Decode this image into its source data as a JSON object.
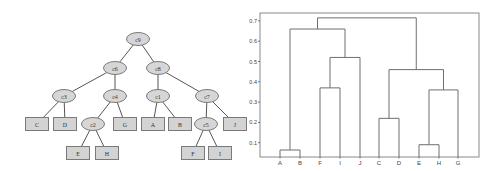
{
  "tree": {
    "nodes": [
      {
        "id": "c9",
        "label": "c9",
        "type": "cluster",
        "x": 138,
        "y": 39
      },
      {
        "id": "c6",
        "label": "c6",
        "type": "cluster",
        "x": 115,
        "y": 68
      },
      {
        "id": "c8",
        "label": "c8",
        "type": "cluster",
        "x": 158,
        "y": 68
      },
      {
        "id": "c3",
        "label": "c3",
        "type": "cluster",
        "x": 64,
        "y": 96
      },
      {
        "id": "c4",
        "label": "c4",
        "type": "cluster",
        "x": 115,
        "y": 96
      },
      {
        "id": "c1",
        "label": "c1",
        "type": "cluster",
        "x": 158,
        "y": 96
      },
      {
        "id": "c7",
        "label": "c7",
        "type": "cluster",
        "x": 207,
        "y": 96
      },
      {
        "id": "c2",
        "label": "c2",
        "type": "cluster",
        "x": 93,
        "y": 124
      },
      {
        "id": "c5",
        "label": "c5",
        "type": "cluster",
        "x": 206,
        "y": 124
      },
      {
        "id": "C",
        "label": "C",
        "type": "leaf",
        "x": 37,
        "y": 124
      },
      {
        "id": "D",
        "label": "D",
        "type": "leaf",
        "x": 65,
        "y": 124
      },
      {
        "id": "G",
        "label": "G",
        "type": "leaf",
        "x": 125,
        "y": 124
      },
      {
        "id": "A",
        "label": "A",
        "type": "leaf",
        "x": 153,
        "y": 124
      },
      {
        "id": "B",
        "label": "B",
        "type": "leaf",
        "x": 180,
        "y": 124
      },
      {
        "id": "J",
        "label": "J",
        "type": "leaf",
        "x": 235,
        "y": 124
      },
      {
        "id": "E",
        "label": "E",
        "type": "leaf",
        "x": 78,
        "y": 153
      },
      {
        "id": "H",
        "label": "H",
        "type": "leaf",
        "x": 107,
        "y": 153
      },
      {
        "id": "F",
        "label": "F",
        "type": "leaf",
        "x": 193,
        "y": 153
      },
      {
        "id": "I",
        "label": "I",
        "type": "leaf",
        "x": 220,
        "y": 153
      }
    ],
    "edges": [
      [
        "c9",
        "c6"
      ],
      [
        "c9",
        "c8"
      ],
      [
        "c6",
        "c3"
      ],
      [
        "c6",
        "c4"
      ],
      [
        "c3",
        "C"
      ],
      [
        "c3",
        "D"
      ],
      [
        "c4",
        "c2"
      ],
      [
        "c4",
        "G"
      ],
      [
        "c2",
        "E"
      ],
      [
        "c2",
        "H"
      ],
      [
        "c8",
        "c1"
      ],
      [
        "c8",
        "c7"
      ],
      [
        "c1",
        "A"
      ],
      [
        "c1",
        "B"
      ],
      [
        "c7",
        "c5"
      ],
      [
        "c7",
        "J"
      ],
      [
        "c5",
        "F"
      ],
      [
        "c5",
        "I"
      ]
    ]
  },
  "dendrogram": {
    "frame": {
      "left": 260,
      "top": 13,
      "right": 479,
      "bottom": 157
    },
    "y_axis": {
      "zero_px": 163,
      "px_per_unit": 203
    },
    "y_ticks": [
      {
        "value": 0.1,
        "label": "0.1"
      },
      {
        "value": 0.2,
        "label": "0.2"
      },
      {
        "value": 0.3,
        "label": "0.3"
      },
      {
        "value": 0.4,
        "label": "0.4"
      },
      {
        "value": 0.5,
        "label": "0.5"
      },
      {
        "value": 0.6,
        "label": "0.6"
      },
      {
        "value": 0.7,
        "label": "0.7"
      }
    ],
    "leaves": [
      {
        "label": "A",
        "x": 280
      },
      {
        "label": "B",
        "x": 300
      },
      {
        "label": "F",
        "x": 320
      },
      {
        "label": "I",
        "x": 340
      },
      {
        "label": "J",
        "x": 360
      },
      {
        "label": "C",
        "x": 379
      },
      {
        "label": "D",
        "x": 399
      },
      {
        "label": "E",
        "x": 419
      },
      {
        "label": "H",
        "x": 439
      },
      {
        "label": "G",
        "x": 458
      }
    ],
    "merges": [
      {
        "id": "c1",
        "left": "A",
        "right": "B",
        "height": 0.064
      },
      {
        "id": "c2",
        "left": "E",
        "right": "H",
        "height": 0.09
      },
      {
        "id": "c3",
        "left": "C",
        "right": "D",
        "height": 0.22
      },
      {
        "id": "c4",
        "left": "c2",
        "right": "G",
        "height": 0.36
      },
      {
        "id": "c5",
        "left": "F",
        "right": "I",
        "height": 0.37
      },
      {
        "id": "c6",
        "left": "c3",
        "right": "c4",
        "height": 0.46
      },
      {
        "id": "c7",
        "left": "c5",
        "right": "J",
        "height": 0.52
      },
      {
        "id": "c8",
        "left": "c1",
        "right": "c7",
        "height": 0.66
      },
      {
        "id": "c9",
        "left": "c8",
        "right": "c6",
        "height": 0.715
      }
    ]
  },
  "colors": {
    "node_fill": "#d6d6d6",
    "node_stroke": "#7a7a7a",
    "edge": "#555555",
    "dendro_line": "#6e6e6e"
  }
}
